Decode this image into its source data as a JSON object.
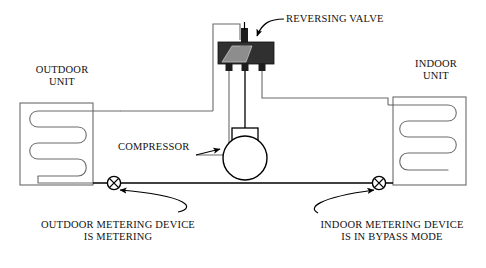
{
  "diagram": {
    "colors": {
      "line_thin": "#6b6b6b",
      "line_bold": "#000000",
      "valve_body": "#2f2f2f",
      "valve_slide": "#8a8a8a",
      "background": "#ffffff",
      "text": "#111111"
    },
    "labels": {
      "outdoor_unit": "OUTDOOR\nUNIT",
      "indoor_unit": "INDOOR\nUNIT",
      "reversing_valve": "REVERSING VALVE",
      "compressor": "COMPRESSOR",
      "outdoor_metering": "OUTDOOR METERING DEVICE\nIS METERING",
      "indoor_metering": "INDOOR METERING DEVICE\nIS IN BYPASS MODE"
    },
    "components": [
      {
        "name": "outdoor-unit",
        "type": "coil-cabinet",
        "passes": 3
      },
      {
        "name": "indoor-unit",
        "type": "coil-cabinet",
        "passes": 3
      },
      {
        "name": "reversing-valve",
        "type": "four-way-valve",
        "ports": 4
      },
      {
        "name": "compressor",
        "type": "circle-with-discharge-stub"
      },
      {
        "name": "outdoor-metering-device",
        "type": "circle-x",
        "state": "METERING"
      },
      {
        "name": "indoor-metering-device",
        "type": "circle-x",
        "state": "BYPASS"
      }
    ]
  }
}
